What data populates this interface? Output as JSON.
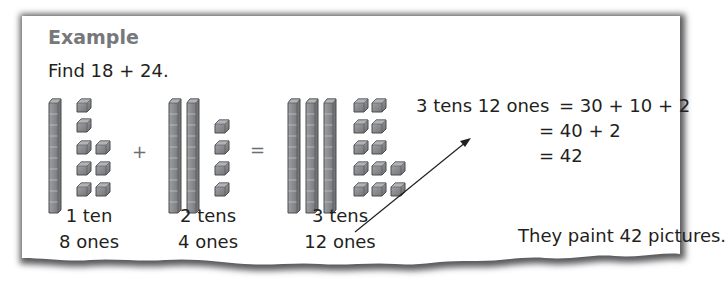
{
  "example": {
    "title": "Example",
    "prompt": "Find 18 + 24.",
    "groups": [
      {
        "tens": 1,
        "ones": 8,
        "caption_tens": "1 ten",
        "caption_ones": "8 ones"
      },
      {
        "tens": 2,
        "ones": 4,
        "caption_tens": "2 tens",
        "caption_ones": "4 ones"
      },
      {
        "tens": 3,
        "ones": 12,
        "caption_tens": "3 tens",
        "caption_ones": "12 ones"
      }
    ],
    "operators": {
      "plus": "+",
      "equals": "="
    },
    "equation": {
      "lhs": "3 tens 12 ones",
      "line1": "= 30 + 10 + 2",
      "line2": "= 40 + 2",
      "line3": "= 42"
    },
    "answer": "They paint 42 pictures."
  },
  "colors": {
    "block_fill": "#8a8b8d",
    "block_top": "#a7a9ac",
    "block_stroke": "#4d4d4f",
    "title": "#77787b",
    "text": "#231f20",
    "panel_shadow": "#6d6e71"
  }
}
